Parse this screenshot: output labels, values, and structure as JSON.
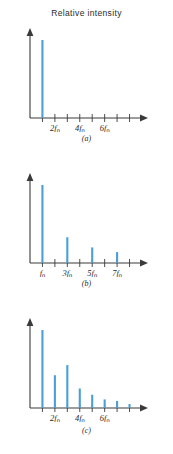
{
  "figure": {
    "title": "Relative intensity",
    "axis_color": "#3a3a3a",
    "bar_color": "#4a9fd4"
  },
  "panels": [
    {
      "caption": "(a)"
    },
    {
      "caption": "(b)"
    },
    {
      "caption": "(c)"
    }
  ],
  "chart_data": [
    {
      "type": "bar",
      "title": "Relative intensity",
      "panel": "(a)",
      "xlabel": "",
      "ylabel": "Relative intensity",
      "grid": false,
      "legend": null,
      "xlim": [
        0,
        8.6
      ],
      "ylim": [
        0,
        1.0
      ],
      "x": [
        1,
        2,
        3,
        4,
        5,
        6,
        7,
        8
      ],
      "values": [
        1.0,
        0,
        0,
        0,
        0,
        0,
        0,
        0
      ],
      "tick_positions": [
        1,
        2,
        3,
        4,
        5,
        6,
        7,
        8
      ],
      "tick_labels": [
        "",
        "2f₀",
        "",
        "4f₀",
        "",
        "6f₀",
        "",
        ""
      ],
      "labeled_ticks": [
        {
          "x": 2,
          "text": "2f",
          "sub": "0"
        },
        {
          "x": 4,
          "text": "4f",
          "sub": "0"
        },
        {
          "x": 6,
          "text": "6f",
          "sub": "0"
        }
      ]
    },
    {
      "type": "bar",
      "title": "",
      "panel": "(b)",
      "xlabel": "",
      "ylabel": "Relative intensity",
      "grid": false,
      "legend": null,
      "xlim": [
        0,
        8.6
      ],
      "ylim": [
        0,
        1.0
      ],
      "x": [
        1,
        3,
        5,
        7
      ],
      "values": [
        1.0,
        0.33,
        0.2,
        0.14
      ],
      "tick_positions": [
        1,
        2,
        3,
        4,
        5,
        6,
        7,
        8
      ],
      "tick_labels": [
        "f₀",
        "",
        "3f₀",
        "",
        "5f₀",
        "",
        "7f₀",
        ""
      ],
      "labeled_ticks": [
        {
          "x": 1,
          "text": "f",
          "sub": "0"
        },
        {
          "x": 3,
          "text": "3f",
          "sub": "0"
        },
        {
          "x": 5,
          "text": "5f",
          "sub": "0"
        },
        {
          "x": 7,
          "text": "7f",
          "sub": "0"
        }
      ]
    },
    {
      "type": "bar",
      "title": "",
      "panel": "(c)",
      "xlabel": "",
      "ylabel": "Relative intensity",
      "grid": false,
      "legend": null,
      "xlim": [
        0,
        8.6
      ],
      "ylim": [
        0,
        1.0
      ],
      "x": [
        1,
        2,
        3,
        4,
        5,
        6,
        7,
        8
      ],
      "values": [
        1.0,
        0.42,
        0.55,
        0.25,
        0.17,
        0.11,
        0.09,
        0.05
      ],
      "tick_positions": [
        1,
        2,
        3,
        4,
        5,
        6,
        7,
        8
      ],
      "tick_labels": [
        "",
        "2f₀",
        "",
        "4f₀",
        "",
        "6f₀",
        "",
        ""
      ],
      "labeled_ticks": [
        {
          "x": 2,
          "text": "2f",
          "sub": "0"
        },
        {
          "x": 4,
          "text": "4f",
          "sub": "0"
        },
        {
          "x": 6,
          "text": "6f",
          "sub": "0"
        }
      ]
    }
  ]
}
